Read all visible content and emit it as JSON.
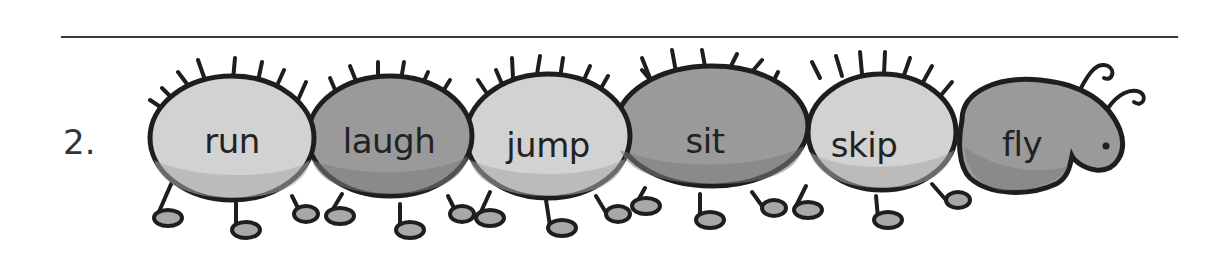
{
  "item_number": "2.",
  "caterpillar": {
    "segments": [
      {
        "word": "run",
        "shade": "light"
      },
      {
        "word": "laugh",
        "shade": "dark"
      },
      {
        "word": "jump",
        "shade": "light"
      },
      {
        "word": "sit",
        "shade": "dark"
      },
      {
        "word": "skip",
        "shade": "light"
      },
      {
        "word": "fly",
        "shade": "dark",
        "is_head": true
      }
    ]
  },
  "colors": {
    "light_fill": "#d2d2d2",
    "light_shadow": "#bababa",
    "dark_fill": "#9a9a9a",
    "dark_shadow": "#858585",
    "outline": "#1e1e1e",
    "rule": "#3a3a3a"
  }
}
